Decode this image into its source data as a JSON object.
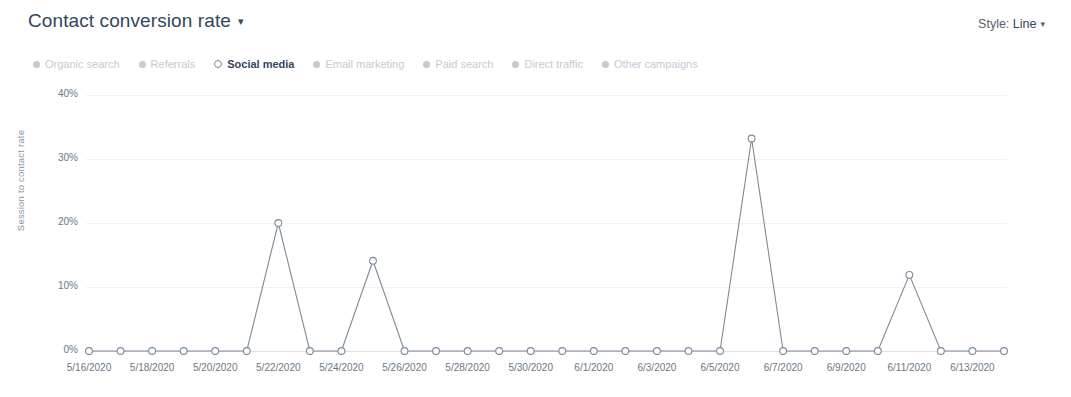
{
  "header": {
    "title": "Contact conversion rate",
    "title_caret": "▾",
    "style_label": "Style:",
    "style_value": "Line",
    "style_caret": "▾"
  },
  "legend": {
    "items": [
      {
        "label": "Organic search",
        "active": false,
        "color": "#c3cbd4"
      },
      {
        "label": "Referrals",
        "active": false,
        "color": "#c3cbd4"
      },
      {
        "label": "Social media",
        "active": true,
        "color": "#7d8a98"
      },
      {
        "label": "Email marketing",
        "active": false,
        "color": "#c3cbd4"
      },
      {
        "label": "Paid search",
        "active": false,
        "color": "#c3cbd4"
      },
      {
        "label": "Direct traffic",
        "active": false,
        "color": "#c3cbd4"
      },
      {
        "label": "Other campaigns",
        "active": false,
        "color": "#c3cbd4"
      }
    ]
  },
  "chart_data": {
    "type": "line",
    "title": "Contact conversion rate",
    "xlabel": "",
    "ylabel": "Session to contact rate",
    "ylim": [
      0,
      40
    ],
    "ytick_labels": [
      "0%",
      "10%",
      "20%",
      "30%",
      "40%"
    ],
    "ytick_values": [
      0,
      10,
      20,
      30,
      40
    ],
    "grid": true,
    "legend_position": "top-left",
    "xtick_labels": [
      "5/16/2020",
      "5/18/2020",
      "5/20/2020",
      "5/22/2020",
      "5/24/2020",
      "5/26/2020",
      "5/28/2020",
      "5/30/2020",
      "6/1/2020",
      "6/3/2020",
      "6/5/2020",
      "6/7/2020",
      "6/9/2020",
      "6/11/2020",
      "6/13/2020"
    ],
    "x": [
      "5/16/2020",
      "5/17/2020",
      "5/18/2020",
      "5/19/2020",
      "5/20/2020",
      "5/21/2020",
      "5/22/2020",
      "5/23/2020",
      "5/24/2020",
      "5/25/2020",
      "5/26/2020",
      "5/27/2020",
      "5/28/2020",
      "5/29/2020",
      "5/30/2020",
      "5/31/2020",
      "6/1/2020",
      "6/2/2020",
      "6/3/2020",
      "6/4/2020",
      "6/5/2020",
      "6/6/2020",
      "6/7/2020",
      "6/8/2020",
      "6/9/2020",
      "6/10/2020",
      "6/11/2020",
      "6/12/2020",
      "6/13/2020",
      "6/14/2020"
    ],
    "series": [
      {
        "name": "Social media",
        "color": "#7d8a98",
        "marker": "open-circle",
        "values": [
          0,
          0,
          0,
          0,
          0,
          0,
          20,
          0,
          0,
          14.1,
          0,
          0,
          0,
          0,
          0,
          0,
          0,
          0,
          0,
          0,
          0,
          33.2,
          0,
          0,
          0,
          0,
          11.9,
          0,
          0,
          0
        ]
      }
    ]
  }
}
